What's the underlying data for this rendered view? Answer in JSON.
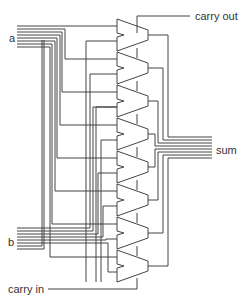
{
  "diagram": {
    "labels": {
      "a": "a",
      "b": "b",
      "carry_in": "carry in",
      "carry_out": "carry out",
      "sum": "sum"
    },
    "adder_count": 8,
    "colors": {
      "line": "#444444",
      "text": "#333333",
      "background": "#ffffff"
    }
  }
}
